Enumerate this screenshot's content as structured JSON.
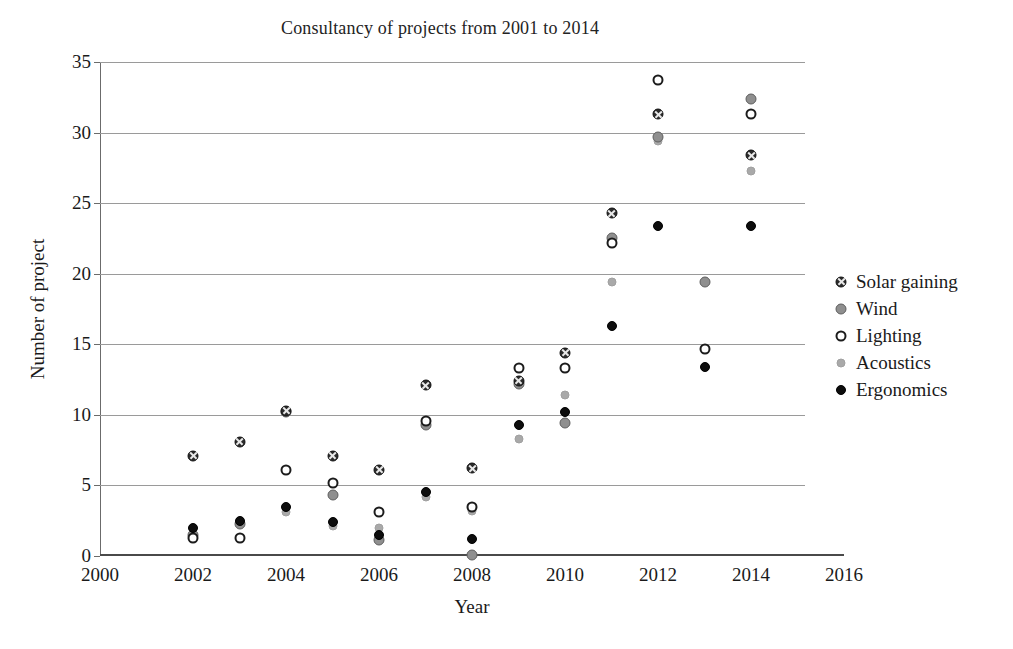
{
  "chart_data": {
    "type": "scatter",
    "title": "Consultancy of projects from 2001 to 2014",
    "xlabel": "Year",
    "ylabel": "Number of project",
    "xlim": [
      2000,
      2016
    ],
    "ylim": [
      0,
      35
    ],
    "xticks": [
      "2000",
      "2002",
      "2004",
      "2006",
      "2008",
      "2010",
      "2012",
      "2014",
      "2016"
    ],
    "yticks": [
      "0",
      "5",
      "10",
      "15",
      "20",
      "25",
      "30",
      "35"
    ],
    "grid": "horizontal",
    "legend_position": "right",
    "x": [
      2002,
      2003,
      2004,
      2005,
      2006,
      2007,
      2008,
      2009,
      2010,
      2011,
      2012,
      2013,
      2014
    ],
    "series": [
      {
        "name": "Solar gaining",
        "marker": "dark-circle-cross",
        "color": "#2b2b2b",
        "values": [
          7.1,
          8.1,
          10.3,
          7.1,
          6.1,
          12.1,
          6.2,
          12.4,
          14.4,
          24.3,
          31.3,
          null,
          28.4
        ]
      },
      {
        "name": "Wind",
        "marker": "gray-filled-circle",
        "color": "#8f8f8f",
        "values": [
          1.5,
          2.3,
          10.2,
          4.3,
          1.1,
          9.3,
          0.1,
          12.2,
          9.4,
          22.5,
          29.7,
          19.4,
          32.4
        ]
      },
      {
        "name": "Lighting",
        "marker": "open-circle",
        "color": "#ffffff",
        "values": [
          1.3,
          1.3,
          6.1,
          5.2,
          3.1,
          9.6,
          3.5,
          13.3,
          13.3,
          22.2,
          33.7,
          14.7,
          31.3
        ]
      },
      {
        "name": "Acoustics",
        "marker": "light-gray-dot",
        "color": "#a9a9a9",
        "values": [
          1.4,
          2.5,
          3.1,
          2.1,
          2.0,
          4.2,
          3.2,
          8.3,
          11.4,
          19.4,
          29.4,
          null,
          27.3
        ]
      },
      {
        "name": "Ergonomics",
        "marker": "solid-black-dot",
        "color": "#0d0d0d",
        "values": [
          2.0,
          2.5,
          3.5,
          2.4,
          1.5,
          4.5,
          1.2,
          9.3,
          10.2,
          16.3,
          23.4,
          13.4,
          23.4
        ]
      }
    ]
  },
  "legend": {
    "items": [
      {
        "label": "Solar gaining"
      },
      {
        "label": "Wind"
      },
      {
        "label": "Lighting"
      },
      {
        "label": "Acoustics"
      },
      {
        "label": "Ergonomics"
      }
    ]
  }
}
